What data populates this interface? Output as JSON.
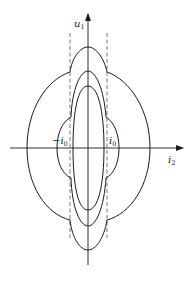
{
  "diagram": {
    "type": "phase-plane / operating-region plot",
    "axes": {
      "vertical": {
        "label_main": "u",
        "label_sub": "1"
      },
      "horizontal": {
        "label_main": "i",
        "label_sub": "2"
      }
    },
    "markers": {
      "left": {
        "label_main": "−i",
        "label_sub": "0"
      },
      "right": {
        "label_main": "i",
        "label_sub": "0"
      }
    },
    "curves": [
      {
        "name": "outer",
        "description": "widest closed curve with wings beyond ±i0"
      },
      {
        "name": "middle",
        "description": "middle closed curve with small bulges beyond ±i0"
      },
      {
        "name": "inner",
        "description": "innermost ellipse inside ±i0"
      }
    ],
    "colors": {
      "stroke": "#1a1a1a",
      "dashed": "#555555",
      "background": "#ffffff"
    }
  }
}
